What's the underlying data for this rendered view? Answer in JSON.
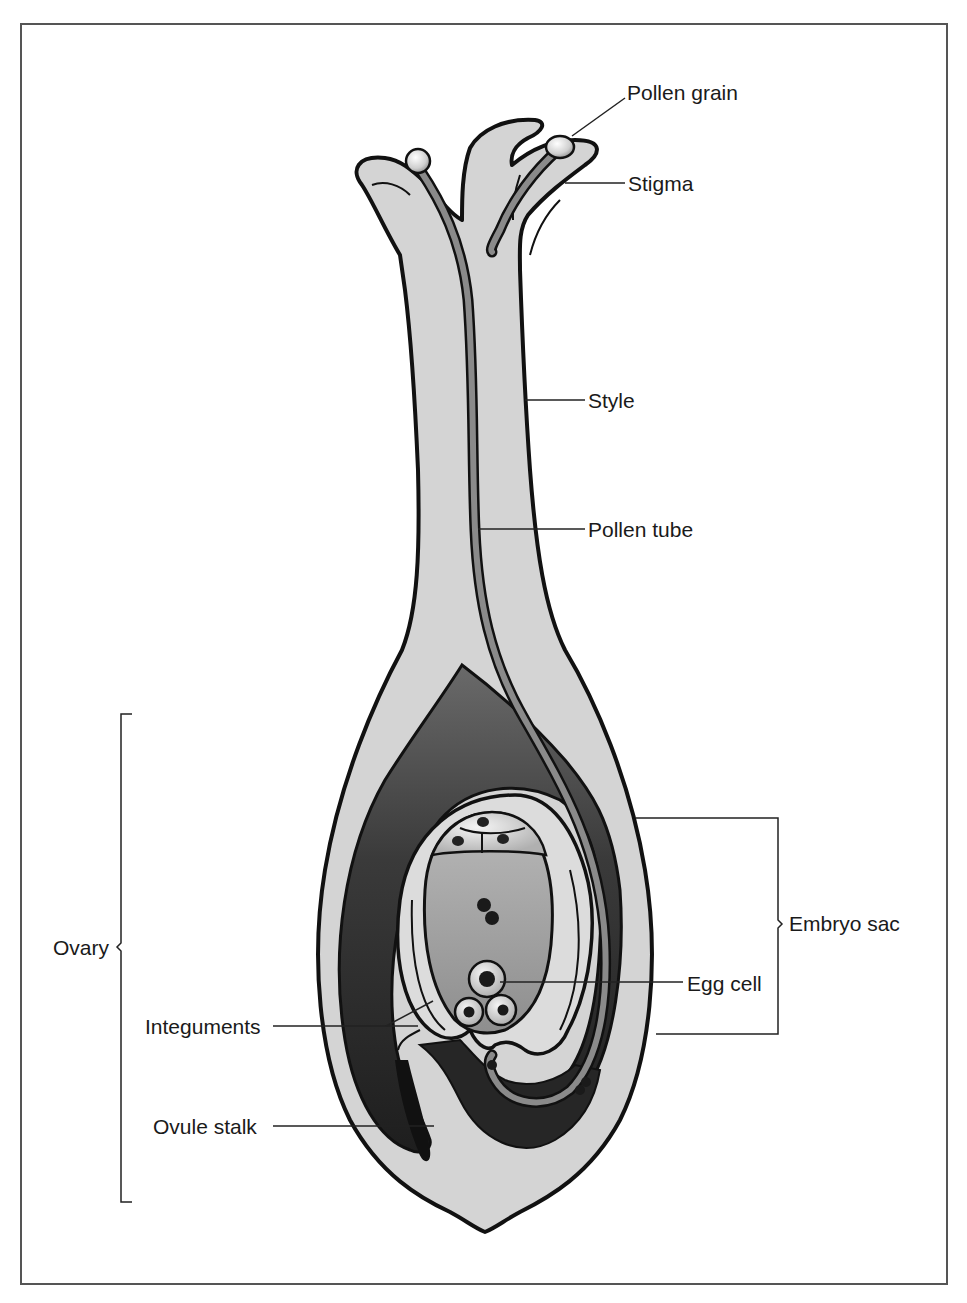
{
  "figure": {
    "colors": {
      "tissue_light": "#d4d4d4",
      "tissue_mid": "#8a8a8a",
      "tissue_dark": "#2e2e2e",
      "embryo_sac": "#a6a6a6",
      "outline": "#111111",
      "frame": "#555555",
      "background": "#ffffff"
    }
  },
  "labels": {
    "pollen_grain": "Pollen grain",
    "stigma": "Stigma",
    "style": "Style",
    "pollen_tube": "Pollen tube",
    "embryo_sac": "Embryo sac",
    "egg_cell": "Egg cell",
    "ovary": "Ovary",
    "integuments": "Integuments",
    "ovule_stalk": "Ovule stalk"
  }
}
